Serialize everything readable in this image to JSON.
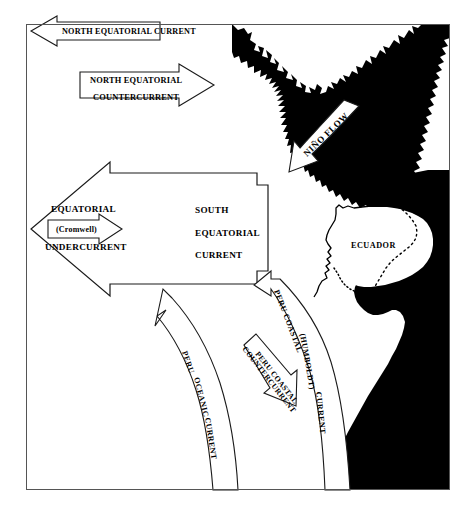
{
  "figure": {
    "background_color": "#ffffff",
    "land_color": "#000000",
    "line_color": "#1a1a1a",
    "frame": {
      "x": 26,
      "y": 24,
      "width": 424,
      "height": 466
    }
  },
  "labels": {
    "north_equatorial_current": "NORTH EQUATORIAL CURRENT",
    "north_equatorial_countercurrent_line1": "NORTH EQUATORIAL",
    "north_equatorial_countercurrent_line2": "COUNTERCURRENT",
    "nino_flow": "NIÑO FLOW",
    "equatorial": "EQUATORIAL",
    "cromwell": "(Cromwell)",
    "undercurrent": "UNDERCURRENT",
    "south": "SOUTH",
    "equatorial2": "EQUATORIAL",
    "current": "CURRENT",
    "ecuador": "ECUADOR",
    "peru_coastal": "PERU COASTAL",
    "humboldt": "(HUMBOLDT)",
    "humboldt_current": "CURRENT",
    "peru_coastal_counter_line1": "PERU COASTAL",
    "peru_coastal_counter_line2": "COUNTERCURRENT",
    "peru_oceanic_line1": "PERU",
    "peru_oceanic_line2": "OCEANIC",
    "peru_oceanic_line3": "CURRENT"
  },
  "currents": [
    {
      "name": "North Equatorial Current",
      "direction": "west"
    },
    {
      "name": "North Equatorial Countercurrent",
      "direction": "east"
    },
    {
      "name": "Niño Flow",
      "direction": "southwest"
    },
    {
      "name": "Equatorial (Cromwell) Undercurrent",
      "direction": "east"
    },
    {
      "name": "South Equatorial Current",
      "direction": "west"
    },
    {
      "name": "Peru Coastal (Humboldt) Current",
      "direction": "northwest"
    },
    {
      "name": "Peru Coastal Countercurrent",
      "direction": "southeast"
    },
    {
      "name": "Peru Oceanic Current",
      "direction": "northwest"
    }
  ],
  "places": [
    {
      "name": "ECUADOR",
      "type": "country"
    },
    {
      "name": "Galapagos Islands",
      "type": "island-group"
    }
  ]
}
